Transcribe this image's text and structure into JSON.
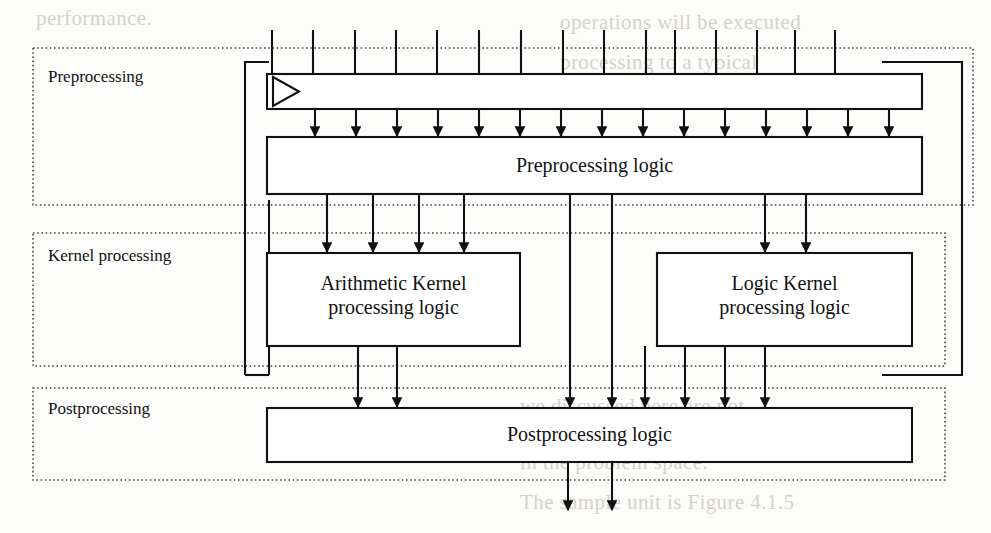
{
  "figure": {
    "type": "block-diagram",
    "background": "#fdfdfc",
    "line_color": "#111111",
    "dotted_color": "#444444"
  },
  "regions": [
    {
      "id": "preprocessing",
      "label": "Preprocessing",
      "x": 33,
      "y": 48,
      "w": 940,
      "h": 157
    },
    {
      "id": "kernel_processing",
      "label": "Kernel processing",
      "x": 33,
      "y": 233,
      "w": 912,
      "h": 133
    },
    {
      "id": "postprocessing",
      "label": "Postprocessing",
      "x": 33,
      "y": 388,
      "w": 912,
      "h": 92
    }
  ],
  "blocks": [
    {
      "id": "bus",
      "label": "",
      "x": 267,
      "y": 74,
      "w": 655,
      "h": 35
    },
    {
      "id": "preprocessing_logic",
      "label": "Preprocessing logic",
      "x": 267,
      "y": 137,
      "w": 655,
      "h": 57
    },
    {
      "id": "arithmetic_kernel",
      "label": "Arithmetic Kernel\nprocessing logic",
      "x": 267,
      "y": 253,
      "w": 253,
      "h": 93
    },
    {
      "id": "logic_kernel",
      "label": "Logic Kernel\nprocessing logic",
      "x": 657,
      "y": 253,
      "w": 255,
      "h": 93
    },
    {
      "id": "postprocessing_logic",
      "label": "Postprocessing logic",
      "x": 267,
      "y": 408,
      "w": 645,
      "h": 54
    }
  ],
  "block_labels": {
    "preprocessing_logic": "Preprocessing logic",
    "arithmetic_kernel_line1": "Arithmetic Kernel",
    "arithmetic_kernel_line2": "processing logic",
    "logic_kernel_line1": "Logic Kernel",
    "logic_kernel_line2": "processing logic",
    "postprocessing_logic": "Postprocessing logic"
  },
  "connections": {
    "top_inputs_x": [
      272,
      313,
      355,
      396,
      437,
      479,
      521,
      563,
      604,
      646,
      675,
      716,
      757,
      795,
      835
    ],
    "bus_to_preprocessing_x": [
      315,
      356,
      397,
      438,
      479,
      520,
      561,
      602,
      643,
      684,
      725,
      766,
      807,
      848,
      889
    ],
    "preprocessing_to_arithmetic_x": [
      327,
      373,
      419,
      464
    ],
    "preprocessing_to_logic_x": [
      765,
      806
    ],
    "preprocessing_passthrough_x": [
      570,
      612
    ],
    "arithmetic_outputs_x": [
      358,
      397
    ],
    "logic_outputs_x": [
      645,
      685,
      725,
      765
    ],
    "bottom_outputs_x": [
      568,
      612
    ],
    "feedback_left_x": 245,
    "feedback_right_x": 962,
    "feedback_top_y": 62,
    "feedback_bottom_y": 375
  },
  "scan_background_text": [
    {
      "text": "performance.",
      "x": 36,
      "y": 8
    },
    {
      "text": "operations will be executed",
      "x": 560,
      "y": 12
    },
    {
      "text": "processing  to  a  typical",
      "x": 560,
      "y": 52
    },
    {
      "text": "construction is clearer in",
      "x": 560,
      "y": 92
    },
    {
      "text": "in general performance is",
      "x": 560,
      "y": 132
    },
    {
      "text": "difference is that we have",
      "x": 560,
      "y": 172
    },
    {
      "text": "we discussed here are not",
      "x": 520,
      "y": 396
    },
    {
      "text": "selection. When designing",
      "x": 520,
      "y": 424
    },
    {
      "text": "in the problem space.",
      "x": 520,
      "y": 452
    },
    {
      "text": "The sample unit is Figure 4.1.5",
      "x": 520,
      "y": 492
    }
  ]
}
